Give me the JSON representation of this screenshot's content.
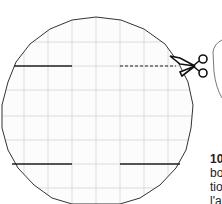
{
  "figure": {
    "colors": {
      "outline": "#333333",
      "grid": "#d8d8d8",
      "cut_line": "#222222",
      "background": "#ffffff"
    }
  },
  "caption": {
    "step_number": "10",
    "lines": [
      "bo",
      "tio",
      "l'a"
    ]
  }
}
